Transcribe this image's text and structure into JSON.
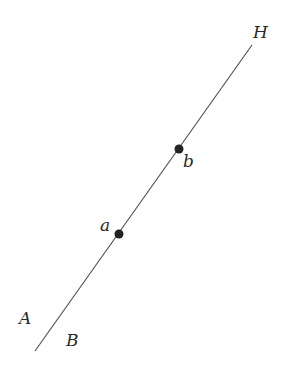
{
  "diagram": {
    "line": {
      "x1": 35,
      "y1": 351,
      "x2": 252,
      "y2": 45,
      "color": "#555555"
    },
    "points": [
      {
        "id": "a",
        "label": "a",
        "x": 119,
        "y": 234,
        "label_x": 100,
        "label_y": 231
      },
      {
        "id": "b",
        "label": "b",
        "x": 179,
        "y": 149,
        "label_x": 183,
        "label_y": 167
      }
    ],
    "labels": [
      {
        "id": "H",
        "text": "H",
        "x": 253,
        "y": 38
      },
      {
        "id": "A",
        "text": "A",
        "x": 19,
        "y": 324
      },
      {
        "id": "B",
        "text": "B",
        "x": 66,
        "y": 346
      }
    ],
    "point_color": "#222222"
  }
}
